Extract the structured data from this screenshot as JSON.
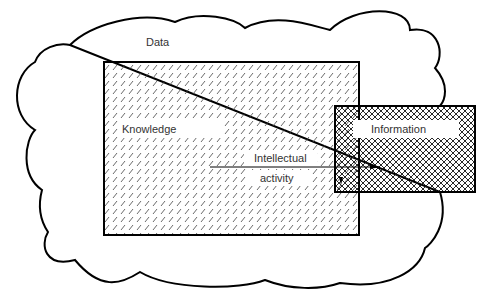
{
  "diagram": {
    "title": "",
    "type": "concept-diagram",
    "nodes": [
      {
        "id": "data",
        "label": "Data",
        "shape": "cloud",
        "fill": "none"
      },
      {
        "id": "knowledge",
        "label": "Knowledge",
        "shape": "rectangle",
        "fill": "diagonal-hatch"
      },
      {
        "id": "information",
        "label": "Information",
        "shape": "rectangle",
        "fill": "cross-hatch"
      }
    ],
    "edges": [
      {
        "from": "knowledge",
        "to": "information",
        "label": "Intellectual activity",
        "style": "arrow"
      }
    ]
  },
  "labels": {
    "data": "Data",
    "knowledge": "Knowledge",
    "information": "Information",
    "intellectual": "Intellectual",
    "activity": "activity"
  },
  "colors": {
    "stroke": "#000000",
    "text": "#333333",
    "background": "#ffffff"
  }
}
